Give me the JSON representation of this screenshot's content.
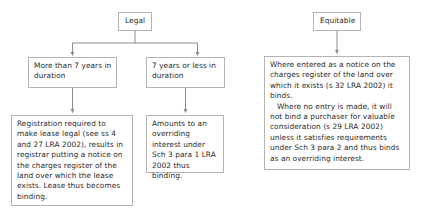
{
  "diagram": {
    "colors": {
      "border": "#b3b3b3",
      "text": "#2b2b2b",
      "connector": "#8c8c8c",
      "background": "#ffffff"
    },
    "nodes": {
      "legal": {
        "label": "Legal"
      },
      "equitable": {
        "label": "Equitable"
      },
      "more_than_7": {
        "label": "More than 7 years in duration"
      },
      "seven_or_less": {
        "label": "7 years or less in duration"
      },
      "registration": {
        "label": "Registration required to make lease legal (see ss 4 and 27 LRA 2002), results in registrar putting a notice on the charges register of the land over which the lease exists. Lease thus becomes binding."
      },
      "overriding": {
        "label": "Amounts to an overriding interest under Sch 3 para 1 LRA 2002 thus binding."
      },
      "equitable_detail": {
        "paragraph_1": "Where entered as a notice on the charges register of the land over which it exists (s 32 LRA 2002) it binds.",
        "paragraph_2": "Where no entry is made, it will not bind a purchaser for valuable consideration (s 29 LRA 2002) unless it satisfies requirements under Sch 3 para 2 and thus binds as an overriding interest."
      }
    },
    "connectors": [
      {
        "name": "legal-to-branch-split"
      },
      {
        "name": "legal-branch-to-more-than-7"
      },
      {
        "name": "legal-branch-to-7-or-less"
      },
      {
        "name": "more-than-7-to-registration"
      },
      {
        "name": "7-or-less-to-overriding"
      },
      {
        "name": "equitable-to-detail"
      }
    ]
  }
}
